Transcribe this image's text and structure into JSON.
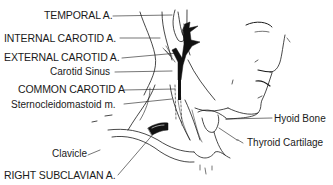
{
  "diagram": {
    "labels_left": [
      {
        "id": "temporal",
        "text": "TEMPORAL A."
      },
      {
        "id": "internal-carotid",
        "text": "INTERNAL CAROTID A."
      },
      {
        "id": "external-carotid",
        "text": "EXTERNAL CAROTID A."
      },
      {
        "id": "carotid-sinus",
        "text": "Carotid Sinus"
      },
      {
        "id": "common-carotid",
        "text": "COMMON CAROTID A"
      },
      {
        "id": "sternocleidomastoid",
        "text": "Sternocleidomastoid m."
      },
      {
        "id": "clavicle",
        "text": "Clavicle"
      },
      {
        "id": "right-subclavian",
        "text": "RIGHT SUBCLAVIAN A."
      }
    ],
    "labels_right": [
      {
        "id": "hyoid-bone",
        "text": "Hyoid Bone"
      },
      {
        "id": "thyroid-cartilage",
        "text": "Thyroid Cartilage"
      }
    ],
    "colors": {
      "line": "#1a1a1a",
      "artery_fill": "#111111",
      "background": "#ffffff"
    }
  }
}
